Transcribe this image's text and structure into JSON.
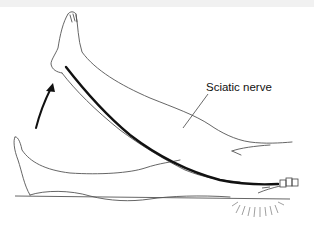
{
  "figure": {
    "labels": {
      "nerve": "Sciatic nerve"
    },
    "colors": {
      "outline": "#555555",
      "nerve": "#111111",
      "arrow": "#111111",
      "background": "#ffffff"
    },
    "elements": [
      "raised-leg",
      "resting-leg",
      "sciatic-nerve",
      "lift-direction-arrow",
      "hand-under-hip",
      "table-surface"
    ]
  }
}
